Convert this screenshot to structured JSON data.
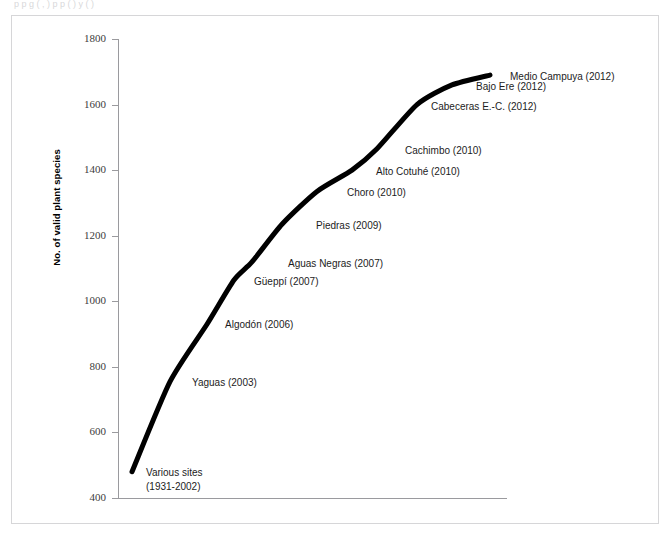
{
  "figure": {
    "top_clipped_caption": "p                 p              g     (          ,      )   p              p     (     )     y                        (    )",
    "border_color": "#d6d6d8",
    "background": "#ffffff",
    "axis_color": "#9a9a9e",
    "curve_color": "#000000"
  },
  "chart_data": {
    "type": "line",
    "title": "",
    "subtitle": "",
    "xlabel": "",
    "ylabel": "No. of valid plant species",
    "ylim": [
      400,
      1800
    ],
    "yticks": [
      400,
      600,
      800,
      1000,
      1200,
      1400,
      1600,
      1800
    ],
    "ytick_labels": [
      "400",
      "600",
      "800",
      "1000",
      "1200",
      "1400",
      "1600",
      "1800"
    ],
    "grid": false,
    "legend": false,
    "x_axis_visible": true,
    "x_axis_ticks": [],
    "series": [
      {
        "name": "Cumulative no. of valid plant species",
        "color": "#000000",
        "line_width": 5,
        "points": [
          {
            "label": "Various sites",
            "label_line2": "(1931-2002)",
            "year": "1931-2002",
            "value": 480,
            "x_index": 0
          },
          {
            "label": "Yaguas (2003)",
            "year": "2003",
            "value": 755,
            "x_index": 1
          },
          {
            "label": "Algodón (2006)",
            "year": "2006",
            "value": 930,
            "x_index": 2
          },
          {
            "label": "Güeppí (2007)",
            "year": "2007",
            "value": 1065,
            "x_index": 3
          },
          {
            "label": "Aguas Negras (2007)",
            "year": "2007",
            "value": 1120,
            "x_index": 4
          },
          {
            "label": "Piedras (2009)",
            "year": "2009",
            "value": 1235,
            "x_index": 5
          },
          {
            "label": "Choro (2010)",
            "year": "2010",
            "value": 1335,
            "x_index": 6
          },
          {
            "label": "Alto Cotuhé (2010)",
            "year": "2010",
            "value": 1400,
            "x_index": 7
          },
          {
            "label": "Cachimbo (2010)",
            "year": "2010",
            "value": 1465,
            "x_index": 8
          },
          {
            "label": "Cabeceras E.-C. (2012)",
            "year": "2012",
            "value": 1600,
            "x_index": 9
          },
          {
            "label": "Bajo Ere (2012)",
            "year": "2012",
            "value": 1660,
            "x_index": 10
          },
          {
            "label": "Medio Campuya (2012)",
            "year": "2012",
            "value": 1690,
            "x_index": 11
          }
        ]
      }
    ],
    "annotations": [
      {
        "text": "Medio Campuya (2012)",
        "value": 1690
      },
      {
        "text": "Bajo Ere (2012)",
        "value": 1660
      },
      {
        "text": "Cabeceras E.-C. (2012)",
        "value": 1600
      },
      {
        "text": "Cachimbo (2010)",
        "value": 1465
      },
      {
        "text": "Alto Cotuhé (2010)",
        "value": 1400
      },
      {
        "text": "Choro (2010)",
        "value": 1335
      },
      {
        "text": "Piedras (2009)",
        "value": 1235
      },
      {
        "text": "Aguas Negras (2007)",
        "value": 1120
      },
      {
        "text": "Güeppí (2007)",
        "value": 1065
      },
      {
        "text": "Algodón (2006)",
        "value": 930
      },
      {
        "text": "Yaguas (2003)",
        "value": 755
      },
      {
        "text": "Various sites",
        "value": 480
      },
      {
        "text": "(1931-2002)",
        "value": 480
      }
    ]
  }
}
